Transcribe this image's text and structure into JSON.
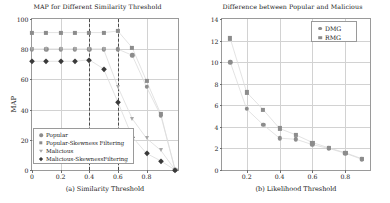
{
  "figure": {
    "panels": [
      "a",
      "b"
    ]
  },
  "chart_data": [
    {
      "type": "scatter",
      "panel": "a",
      "title": "MAP for Different Similarity Threshold",
      "xlabel": "(a) Similarity Threshold",
      "ylabel": "MAP",
      "xlim": [
        0,
        1.02
      ],
      "ylim": [
        0,
        100
      ],
      "xticks": [
        0,
        0.2,
        0.4,
        0.6,
        0.8
      ],
      "xticklabels": [
        "0",
        "0.2",
        "0.4",
        "0.6",
        "0.8"
      ],
      "yticks": [
        0,
        20,
        40,
        60,
        80,
        100
      ],
      "yticklabels": [
        "0",
        "20",
        "40",
        "60",
        "80",
        "100"
      ],
      "grid": true,
      "legend_position": "lower left",
      "annotations": [
        {
          "type": "vline",
          "x": 0.4,
          "style": "dashed"
        },
        {
          "type": "vline",
          "x": 0.6,
          "style": "dashed"
        }
      ],
      "x": [
        0,
        0.1,
        0.2,
        0.3,
        0.4,
        0.5,
        0.6,
        0.7,
        0.8,
        0.9,
        1.0
      ],
      "series": [
        {
          "name": "Popular",
          "marker": "circle",
          "color": "#8c8c8c",
          "values": [
            80,
            80,
            80,
            80,
            80,
            80,
            80,
            76,
            55,
            36,
            0
          ]
        },
        {
          "name": "Popular-Skewness Filtering",
          "marker": "square",
          "color": "#8c8c8c",
          "values": [
            91,
            91,
            91,
            91,
            91,
            91,
            92,
            81,
            59,
            37,
            0
          ]
        },
        {
          "name": "Malicious",
          "marker": "triangle-down",
          "color": "#a8a8a8",
          "values": [
            80,
            80,
            80,
            80,
            80,
            80,
            55,
            34,
            21,
            13,
            0
          ]
        },
        {
          "name": "Malicious-SkewnessFiltering",
          "marker": "diamond",
          "color": "#3a3a3a",
          "values": [
            72,
            72,
            72,
            72,
            73,
            67,
            45,
            22,
            11,
            6,
            0
          ]
        }
      ]
    },
    {
      "type": "scatter",
      "panel": "b",
      "title": "Difference between Popular and Malicious",
      "xlabel": "(b) Likelihood Threshold",
      "ylabel": "",
      "xlim": [
        0.05,
        0.95
      ],
      "ylim": [
        0,
        14
      ],
      "xticks": [
        0.2,
        0.4,
        0.6,
        0.8
      ],
      "xticklabels": [
        "0.2",
        "0.4",
        "0.6",
        "0.8"
      ],
      "yticks": [
        0,
        2,
        4,
        6,
        8,
        10,
        12,
        14
      ],
      "yticklabels": [
        "0",
        "2",
        "4",
        "6",
        "8",
        "10",
        "12",
        "14"
      ],
      "grid": true,
      "legend_position": "upper right",
      "x": [
        0.1,
        0.2,
        0.3,
        0.4,
        0.5,
        0.6,
        0.7,
        0.8,
        0.9
      ],
      "series": [
        {
          "name": "DMG",
          "marker": "circle",
          "color": "#8c8c8c",
          "values": [
            10.0,
            5.65,
            4.2,
            2.95,
            2.85,
            2.35,
            2.0,
            1.55,
            1.0
          ]
        },
        {
          "name": "RMG",
          "marker": "square",
          "color": "#8c8c8c",
          "values": [
            12.2,
            7.2,
            5.6,
            3.85,
            3.25,
            2.55,
            2.05,
            1.6,
            1.05
          ]
        }
      ]
    }
  ]
}
